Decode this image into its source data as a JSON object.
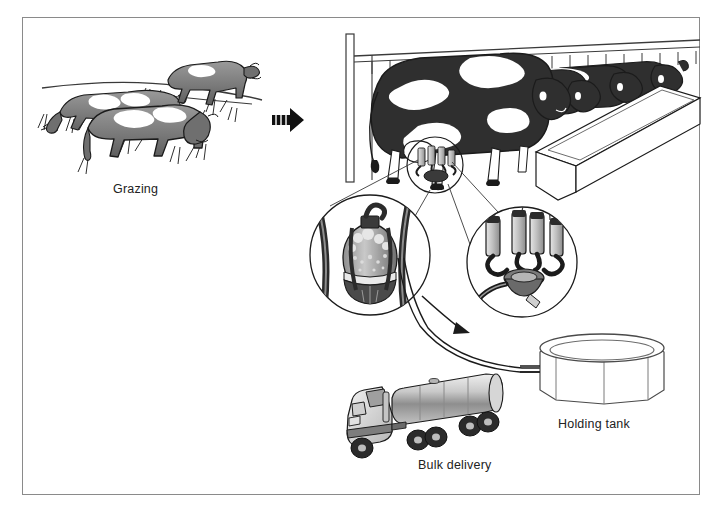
{
  "figure": {
    "background_color": "#ffffff",
    "frame_color": "#8a8a8a",
    "ink_color": "#1b1b1b"
  },
  "labels": {
    "grazing": "Grazing",
    "bulk_delivery": "Bulk delivery",
    "holding_tank": "Holding tank"
  },
  "panels": [
    {
      "name": "grazing-scene",
      "label": "Grazing",
      "description": "Three Holstein cows grazing on a pasture hillside with grass tufts and a horizon line",
      "cow_count": 3
    },
    {
      "name": "milking-parlour",
      "label": "",
      "description": "Row of four Holstein cows standing at a long feed trough behind a railing, with a milking cluster attached to the nearest cow's udder",
      "cow_count": 4
    },
    {
      "name": "detail-milk-receiver",
      "label": "",
      "description": "Magnified circle showing the milk receiver jar with foam and suction hoses"
    },
    {
      "name": "detail-teat-cups",
      "label": "",
      "description": "Magnified circle showing four teat cups joined to the claw bowl"
    },
    {
      "name": "holding-tank",
      "label": "Holding tank",
      "description": "Open-top cylindrical faceted bulk storage tank fed by the milk pipeline"
    },
    {
      "name": "bulk-delivery-truck",
      "label": "Bulk delivery",
      "description": "Tanker truck with cab and polished cylindrical milk trailer"
    }
  ],
  "flow": {
    "stage_arrow": "stage-arrow-right",
    "pipeline_arrow": "pipeline-flow-arrow",
    "sequence": [
      "Grazing",
      "Milking",
      "Holding tank",
      "Bulk delivery"
    ]
  },
  "palette": {
    "cow_body": "#7d7d7d",
    "cow_dark": "#2b2b2b",
    "cow_white": "#ffffff",
    "outline": "#1b1b1b",
    "metal_light": "#d7d7d7",
    "metal_mid": "#9a9a9a",
    "shadow": "#5a5a5a"
  }
}
